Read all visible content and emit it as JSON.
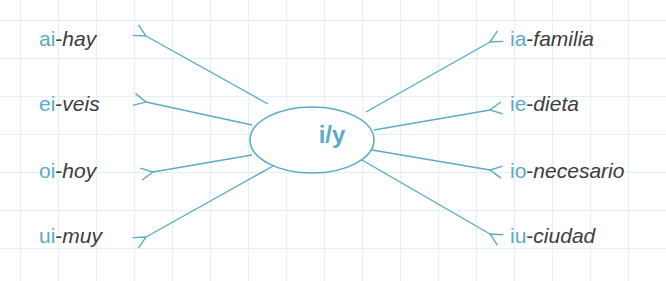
{
  "diagram": {
    "center": "i/y",
    "accent_color": "#5aabc4",
    "text_color": "#3c3c3c",
    "left": [
      {
        "prefix": "ai",
        "word": "hay"
      },
      {
        "prefix": "ei",
        "word": "veis"
      },
      {
        "prefix": "oi",
        "word": "hoy"
      },
      {
        "prefix": "ui",
        "word": "muy"
      }
    ],
    "right": [
      {
        "prefix": "ia",
        "word": "familia"
      },
      {
        "prefix": "ie",
        "word": "dieta"
      },
      {
        "prefix": "io",
        "word": "necesario"
      },
      {
        "prefix": "iu",
        "word": "ciudad"
      }
    ],
    "separator": "-"
  }
}
